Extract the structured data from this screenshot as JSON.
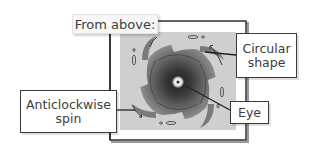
{
  "diagram": {
    "title": "From above:",
    "labels": {
      "circular_shape_line1": "Circular",
      "circular_shape_line2": "shape",
      "spin_line1": "Anticlockwise",
      "spin_line2": "spin",
      "eye": "Eye"
    },
    "colors": {
      "frame": "#3a3a3a",
      "panel": "#cfcfcf",
      "storm_outer": "#8a8a8a",
      "storm_inner": "#2e2e2e",
      "eye": "#f2f2f2",
      "text": "#3d3d3d"
    }
  }
}
